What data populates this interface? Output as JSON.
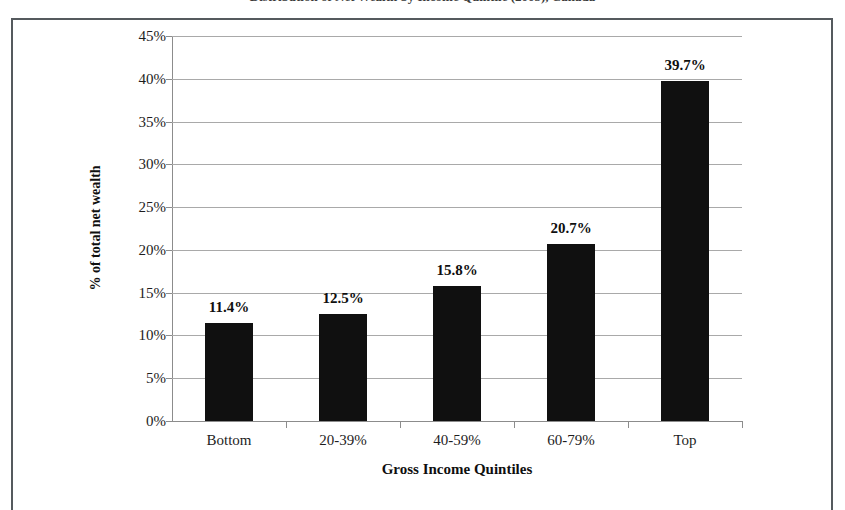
{
  "page": {
    "clipped_heading": "Distribution of Net Wealth by Income Quintile (2005), Canada"
  },
  "chart_data": {
    "type": "bar",
    "title": "",
    "xlabel": "Gross Income Quintiles",
    "ylabel": "% of total net wealth",
    "categories": [
      "Bottom",
      "20-39%",
      "40-59%",
      "60-79%",
      "Top"
    ],
    "values": [
      11.4,
      12.5,
      15.8,
      20.7,
      39.7
    ],
    "data_labels": [
      "11.4%",
      "12.5%",
      "15.8%",
      "20.7%",
      "39.7%"
    ],
    "ylim": [
      0,
      45
    ],
    "ytick_values": [
      0,
      5,
      10,
      15,
      20,
      25,
      30,
      35,
      40,
      45
    ],
    "ytick_labels": [
      "0%",
      "5%",
      "10%",
      "15%",
      "20%",
      "25%",
      "30%",
      "35%",
      "40%",
      "45%"
    ],
    "grid": true,
    "legend": "none",
    "bar_color": "#101010",
    "gridline_color": "#a9a9a9",
    "axis_color": "#8c8c8c",
    "text_color": "#0f0f0f"
  }
}
